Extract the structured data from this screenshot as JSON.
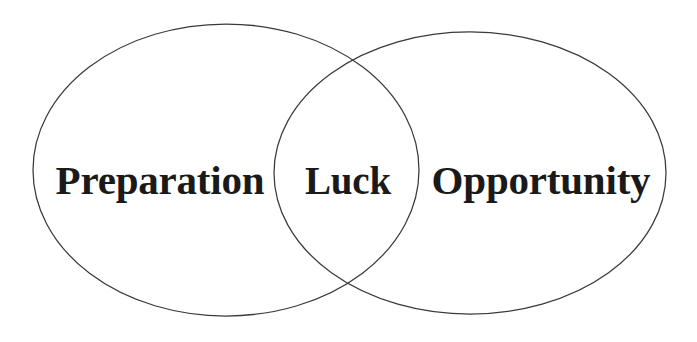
{
  "diagram": {
    "type": "venn",
    "background_color": "#ffffff",
    "stroke_color": "#3a3a3a",
    "text_color": "#1a1a1a",
    "sets": [
      {
        "id": "preparation",
        "label": "Preparation",
        "position": "left",
        "center_x": 226,
        "center_y": 170,
        "radius_x": 193,
        "radius_y": 146
      },
      {
        "id": "opportunity",
        "label": "Opportunity",
        "position": "right",
        "center_x": 470,
        "center_y": 173,
        "radius_x": 196,
        "radius_y": 141
      }
    ],
    "intersection": {
      "id": "luck",
      "label": "Luck",
      "members": [
        "preparation",
        "opportunity"
      ],
      "center_x": 348,
      "center_y": 172
    }
  }
}
